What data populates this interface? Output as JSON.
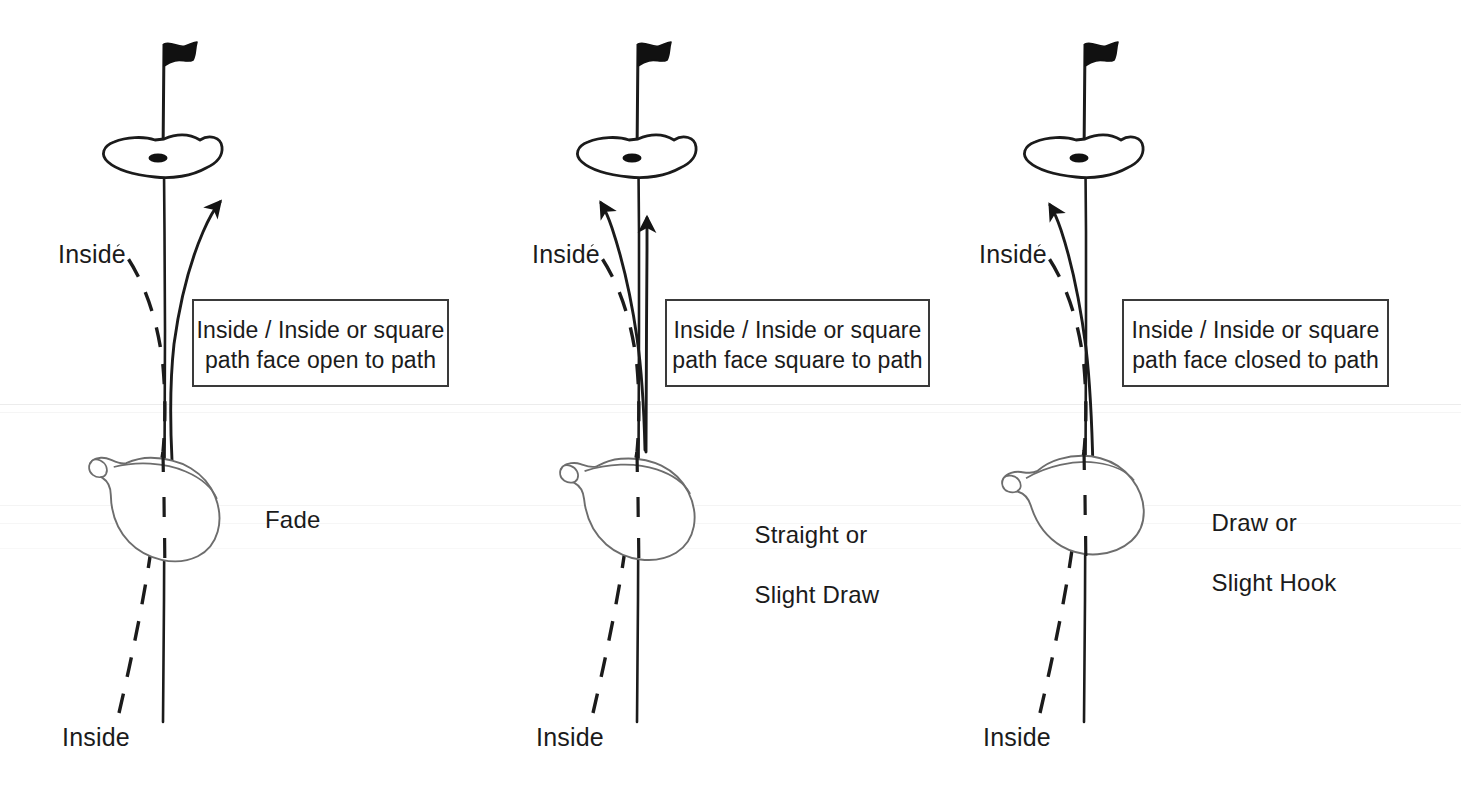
{
  "figure": {
    "kind": "golf-ball-flight-diagram",
    "background_color": "#ffffff",
    "ink_color": "#1b1b1b",
    "panel_count": 3
  },
  "panels": [
    {
      "id": "panel-fade",
      "inside_label_top": "Inside",
      "inside_label_bottom": "Inside",
      "callout_line1": "Inside / Inside or square",
      "callout_line2": "path face open to path",
      "result_line1": "Fade",
      "result_line2": "",
      "club_face": "open",
      "ball_flight": "curves right",
      "arrow_count": 1
    },
    {
      "id": "panel-straight",
      "inside_label_top": "Inside",
      "inside_label_bottom": "Inside",
      "callout_line1": "Inside / Inside or square",
      "callout_line2": "path face square to path",
      "result_line1": "Straight or",
      "result_line2": "Slight Draw",
      "club_face": "square",
      "ball_flight": "straight and slight left",
      "arrow_count": 2
    },
    {
      "id": "panel-draw",
      "inside_label_top": "Inside",
      "inside_label_bottom": "Inside",
      "callout_line1": "Inside / Inside or square",
      "callout_line2": "path face closed to path",
      "result_line1": "Draw or",
      "result_line2": "Slight Hook",
      "club_face": "closed",
      "ball_flight": "curves left",
      "arrow_count": 1
    }
  ],
  "icons": {
    "flag": "golf-flag-icon",
    "green": "putting-green-icon",
    "hole": "golf-hole-icon",
    "club": "driver-clubhead-icon",
    "arrow": "ball-flight-arrow-icon",
    "target_line": "target-line-icon",
    "inside_path": "inside-path-dashed-line-icon"
  }
}
